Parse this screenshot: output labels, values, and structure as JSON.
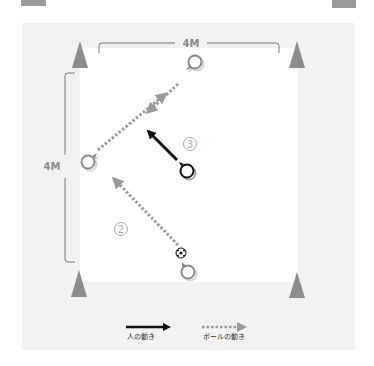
{
  "diagram": {
    "type": "soccer-drill",
    "colors": {
      "outer_bg": "#f2f2f2",
      "field_bg": "#ffffff",
      "cone": "#8c8c8c",
      "player_gray": "#8a8a8a",
      "player_active": "#111111",
      "ball_pass": "#9a9a9a",
      "run_arrow": "#111111",
      "bracket": "#777777"
    },
    "dimensions": {
      "top": "4M",
      "left": "4M"
    },
    "steps": {
      "step2": "2",
      "step3": "3"
    },
    "cones": [
      {
        "position": "top-left"
      },
      {
        "position": "top-right"
      },
      {
        "position": "bottom-left"
      },
      {
        "position": "bottom-right"
      }
    ],
    "players": [
      {
        "id": "top",
        "state": "gray"
      },
      {
        "id": "left",
        "state": "gray"
      },
      {
        "id": "bottom",
        "state": "gray"
      },
      {
        "id": "center",
        "state": "active"
      }
    ],
    "ball": {
      "icon": "soccer-ball-icon"
    }
  },
  "legend": {
    "person_movement": "人の動き",
    "ball_movement": "ボールの動き"
  }
}
